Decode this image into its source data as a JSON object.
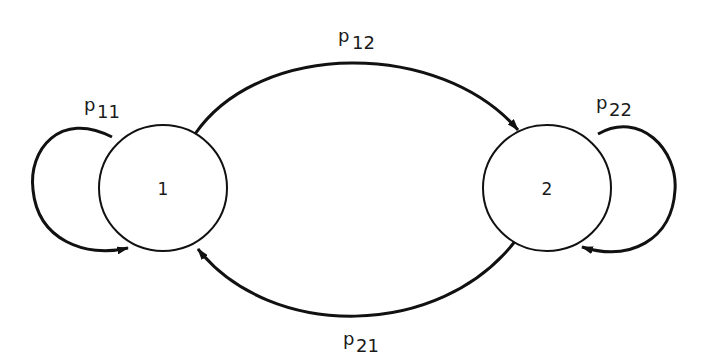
{
  "diagram": {
    "type": "markov-chain-state-transition",
    "states": [
      {
        "id": "1",
        "label": "1"
      },
      {
        "id": "2",
        "label": "2"
      }
    ],
    "transitions": [
      {
        "from": "1",
        "to": "1",
        "label_main": "p",
        "label_sub": "11"
      },
      {
        "from": "1",
        "to": "2",
        "label_main": "p",
        "label_sub": "12"
      },
      {
        "from": "2",
        "to": "1",
        "label_main": "p",
        "label_sub": "21"
      },
      {
        "from": "2",
        "to": "2",
        "label_main": "p",
        "label_sub": "22"
      }
    ]
  },
  "colors": {
    "stroke": "#111111",
    "background": "#ffffff"
  }
}
